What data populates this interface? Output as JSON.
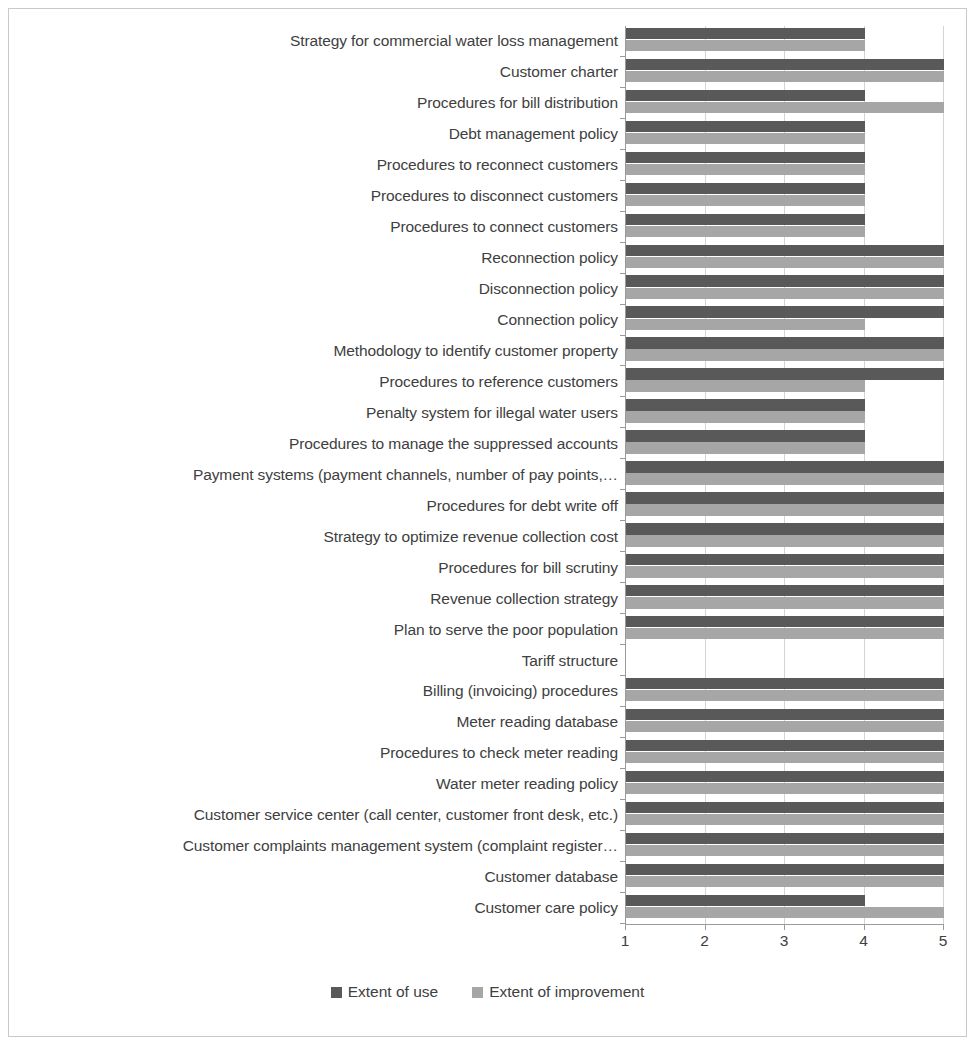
{
  "chart_data": {
    "type": "bar",
    "orientation": "horizontal",
    "title": "",
    "subtitle": "",
    "xlabel": "",
    "ylabel": "",
    "xlim": [
      1,
      5
    ],
    "xticks": [
      "1",
      "2",
      "3",
      "4",
      "5"
    ],
    "grid": true,
    "legend_position": "bottom",
    "series": [
      {
        "name": "Extent of use",
        "color": "#595959",
        "values": [
          4,
          5,
          4,
          4,
          4,
          4,
          4,
          5,
          5,
          5,
          5,
          5,
          4,
          4,
          5,
          5,
          5,
          5,
          5,
          5,
          null,
          5,
          5,
          5,
          5,
          5,
          5,
          5,
          4
        ]
      },
      {
        "name": "Extent of improvement",
        "color": "#a6a6a6",
        "values": [
          4,
          5,
          5,
          4,
          4,
          4,
          4,
          5,
          5,
          4,
          5,
          4,
          4,
          4,
          5,
          5,
          5,
          5,
          5,
          5,
          null,
          5,
          5,
          5,
          5,
          5,
          5,
          5,
          5
        ]
      }
    ],
    "categories": [
      "Strategy for commercial water loss management",
      "Customer charter",
      "Procedures for bill distribution",
      "Debt management policy",
      "Procedures to reconnect customers",
      "Procedures to disconnect customers",
      "Procedures to connect customers",
      "Reconnection policy",
      "Disconnection policy",
      "Connection policy",
      "Methodology to identify customer property",
      "Procedures to reference customers",
      "Penalty system  for illegal water users",
      "Procedures to manage the suppressed accounts",
      "Payment systems (payment channels, number of pay points,…",
      "Procedures for debt write off",
      "Strategy to optimize revenue collection cost",
      "Procedures for bill scrutiny",
      "Revenue collection strategy",
      "Plan to serve the poor population",
      "Tariff structure",
      "Billing (invoicing) procedures",
      "Meter reading database",
      "Procedures to check meter reading",
      "Water meter reading policy",
      "Customer service center (call center, customer front desk, etc.)",
      "Customer complaints management system (complaint register…",
      "Customer database",
      "Customer care policy"
    ]
  },
  "legend": {
    "items": [
      {
        "label": "Extent of use",
        "color": "#595959"
      },
      {
        "label": "Extent of improvement",
        "color": "#a6a6a6"
      }
    ]
  },
  "colors": {
    "use": "#595959",
    "improvement": "#a6a6a6",
    "axis": "#9a9a9a",
    "grid": "#d4d4d4",
    "text": "#404040",
    "frame": "#c9c9c9",
    "background": "#ffffff"
  }
}
